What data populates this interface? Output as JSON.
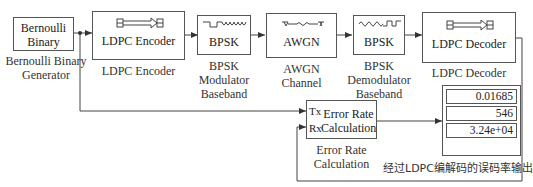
{
  "blocks": {
    "bernoulli": {
      "inner_line1": "Bernoulli",
      "inner_line2": "Binary",
      "caption_line1": "Bernoulli Binary",
      "caption_line2": "Generator"
    },
    "ldpc_encoder": {
      "inner": "LDPC Encoder",
      "caption": "LDPC Encoder",
      "icon": "matrix-arrow-icon"
    },
    "bpsk_mod": {
      "inner": "BPSK",
      "caption_line1": "BPSK",
      "caption_line2": "Modulator",
      "caption_line3": "Baseband",
      "icon": "square-to-sine-wave-icon"
    },
    "awgn": {
      "inner": "AWGN",
      "caption_line1": "AWGN",
      "caption_line2": "Channel",
      "icon": "noise-channel-icon"
    },
    "bpsk_demod": {
      "inner": "BPSK",
      "caption_line1": "BPSK",
      "caption_line2": "Demodulator",
      "caption_line3": "Baseband",
      "icon": "sine-to-square-wave-icon"
    },
    "ldpc_decoder": {
      "inner": "LDPC Decoder",
      "caption": "LDPC Decoder",
      "icon": "matrix-arrow-icon"
    },
    "error_rate": {
      "port_tx": "Tx",
      "port_rx": "Rx",
      "inner_line1": "Error Rate",
      "inner_line2": "Calculation",
      "caption_line1": "Error Rate",
      "caption_line2": "Calculation"
    },
    "display": {
      "values": [
        "0.01685",
        "546",
        "3.24e+04"
      ],
      "caption": "经过LDPC编解码的误码率输出"
    }
  },
  "colors": {
    "line": "#444444",
    "border": "#555555",
    "background": "#ffffff"
  }
}
